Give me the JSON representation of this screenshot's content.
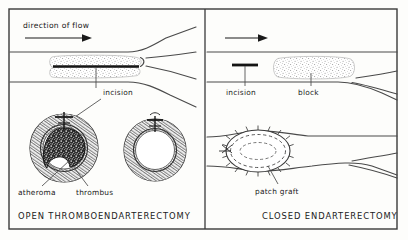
{
  "figure": {
    "type": "medical-illustration",
    "border_color": "#3a3a3a",
    "ink_color": "#1a1a1a",
    "stipple_color": "#8d8d8d",
    "background_color": "#fdfdfb"
  },
  "panels": [
    {
      "id": "open",
      "title": "OPEN THROMBOENDARTERECTOMY",
      "annotations": {
        "flow": "direction of flow",
        "incision": "incision",
        "atheroma": "atheroma",
        "thrombus": "thrombus"
      },
      "icons": {
        "flow_arrow": "arrow-right-icon",
        "longitudinal_vessel": "artery-bifurcation-icon",
        "plaque": "stippled-plaque-icon",
        "incision_line": "long-incision-icon",
        "cross_section_diseased": "artery-cross-section-occluded-icon",
        "cross_section_cleared": "artery-cross-section-patent-icon"
      }
    },
    {
      "id": "closed",
      "title": "CLOSED ENDARTERECTOMY",
      "annotations": {
        "incision": "incision",
        "block": "block",
        "patch_graft": "patch graft"
      },
      "icons": {
        "flow_arrow": "arrow-right-icon",
        "longitudinal_vessel": "artery-bifurcation-icon",
        "plaque": "stippled-plaque-icon",
        "incision_line": "short-incision-icon",
        "patch_graft": "sutured-patch-graft-icon"
      }
    }
  ]
}
